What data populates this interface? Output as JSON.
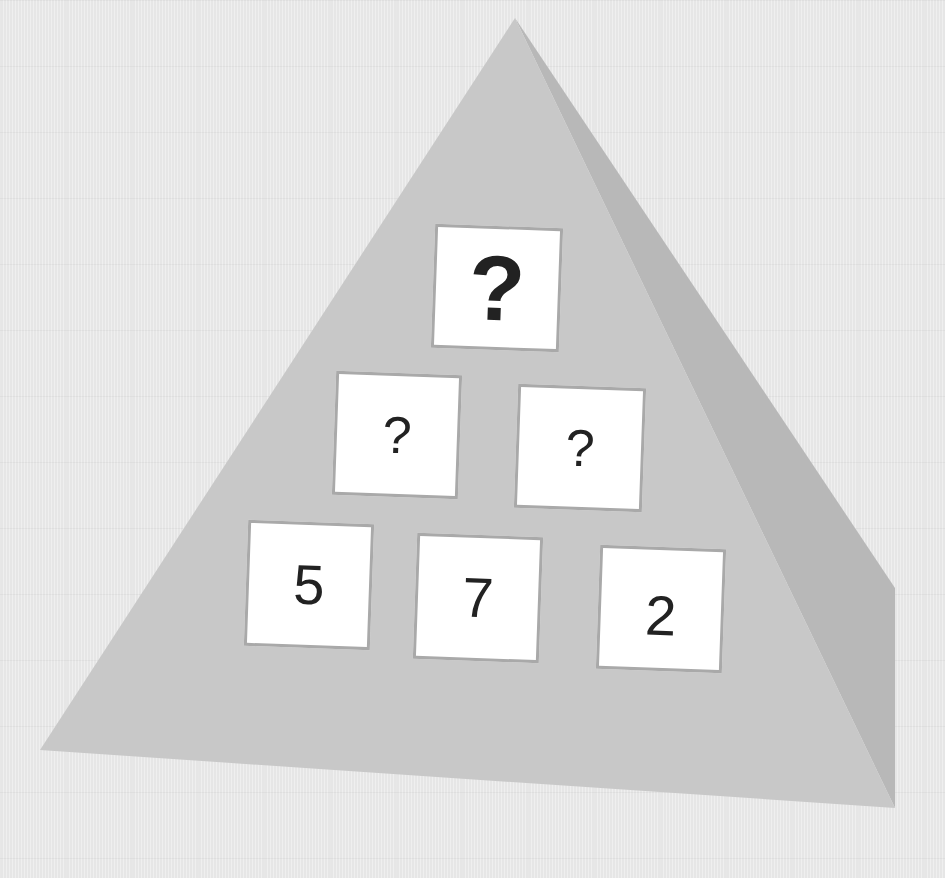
{
  "puzzle": {
    "type": "number-pyramid",
    "colors": {
      "background": "#e6e6e6",
      "pyramid_front": "#c9c9c9",
      "pyramid_side": "#b9b9b9",
      "tile_fill": "#ffffff",
      "tile_border": "#a9a9a9",
      "text": "#222222"
    },
    "rows": [
      {
        "row": "top",
        "cells": [
          {
            "value": "?",
            "style": "bold-large"
          }
        ]
      },
      {
        "row": "middle",
        "cells": [
          {
            "value": "?"
          },
          {
            "value": "?"
          }
        ]
      },
      {
        "row": "bottom",
        "cells": [
          {
            "value": "5"
          },
          {
            "value": "7"
          },
          {
            "value": "2"
          }
        ]
      }
    ]
  }
}
